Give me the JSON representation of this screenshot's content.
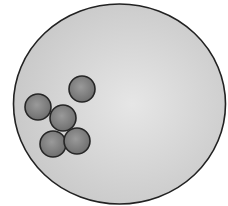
{
  "diagram": {
    "width": 228,
    "height": 206,
    "background": "#ffffff",
    "container": {
      "shape": "ellipse",
      "cx": 119.5,
      "cy": 104,
      "rx": 106,
      "ry": 100,
      "fill_center": "#e6e6e6",
      "fill_edge": "#c6c6c6",
      "highlight_cx": 0.56,
      "highlight_cy": 0.5,
      "stroke": "#222222",
      "stroke_width": 1.6
    },
    "particles": {
      "radius": 13,
      "fill_center": "#9a9a9a",
      "fill_edge": "#6e6e6e",
      "stroke": "#262626",
      "stroke_width": 1.6,
      "items": [
        {
          "id": "particle-top",
          "cx": 82,
          "cy": 89
        },
        {
          "id": "particle-left",
          "cx": 38,
          "cy": 107
        },
        {
          "id": "particle-middle",
          "cx": 63,
          "cy": 118
        },
        {
          "id": "particle-bottom-left",
          "cx": 53,
          "cy": 144
        },
        {
          "id": "particle-bottom-right",
          "cx": 77,
          "cy": 141
        }
      ]
    }
  }
}
